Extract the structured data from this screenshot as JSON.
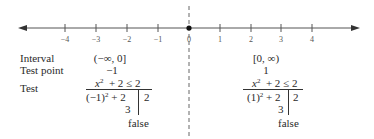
{
  "number_line": {
    "ticks": [
      "−4",
      "−3",
      "−2",
      "−1",
      "0",
      "1",
      "2",
      "3",
      "4"
    ],
    "closed_point": "0",
    "divider": "dashed vertical line at 0"
  },
  "rows": {
    "interval_label": "Interval",
    "test_point_label": "Test point",
    "test_label": "Test"
  },
  "left": {
    "interval": "(−∞, 0]",
    "test_point": "−1",
    "inequality_lhs_var": "x",
    "inequality_rest": "+ 2 ≤ 2",
    "substitution_base": "(−1)",
    "substitution_rest": "+ 2",
    "rhs": "2",
    "evaluated": "3",
    "result": "false"
  },
  "right": {
    "interval": "[0, ∞)",
    "test_point": "1",
    "inequality_lhs_var": "x",
    "inequality_rest": "+ 2 ≤ 2",
    "substitution_base": "(1)",
    "substitution_rest": "+ 2",
    "rhs": "2",
    "evaluated": "3",
    "result": "false"
  },
  "exponent": "2"
}
